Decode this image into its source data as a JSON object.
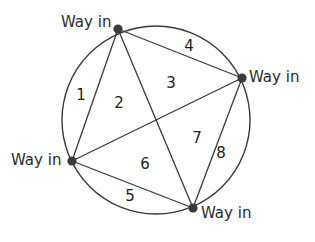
{
  "figure": {
    "type": "circle-chord-region-diagram",
    "background_color": "#ffffff",
    "stroke_color": "#3a3a3a",
    "dot_color": "#3b3b3b",
    "text_color": "#2b2b2b",
    "circle": {
      "cx": 156,
      "cy": 120,
      "r": 94
    },
    "vertices": [
      {
        "id": "top",
        "label": "Way in",
        "x": 118,
        "y": 29
      },
      {
        "id": "right",
        "label": "Way in",
        "x": 242,
        "y": 78
      },
      {
        "id": "left",
        "label": "Way in",
        "x": 72,
        "y": 161
      },
      {
        "id": "bottom",
        "label": "Way in",
        "x": 193,
        "y": 208
      }
    ],
    "chords": [
      {
        "from": "top",
        "to": "right"
      },
      {
        "from": "top",
        "to": "left"
      },
      {
        "from": "top",
        "to": "bottom"
      },
      {
        "from": "left",
        "to": "right"
      },
      {
        "from": "left",
        "to": "bottom"
      },
      {
        "from": "right",
        "to": "bottom"
      }
    ],
    "regions": [
      {
        "id": "1",
        "label": "1",
        "x": 81,
        "y": 95
      },
      {
        "id": "2",
        "label": "2",
        "x": 119,
        "y": 103
      },
      {
        "id": "3",
        "label": "3",
        "x": 171,
        "y": 83
      },
      {
        "id": "4",
        "label": "4",
        "x": 189,
        "y": 46
      },
      {
        "id": "5",
        "label": "5",
        "x": 130,
        "y": 196
      },
      {
        "id": "6",
        "label": "6",
        "x": 145,
        "y": 164
      },
      {
        "id": "7",
        "label": "7",
        "x": 197,
        "y": 138
      },
      {
        "id": "8",
        "label": "8",
        "x": 221,
        "y": 153
      }
    ]
  },
  "labels": {
    "way_in_top": "Way in",
    "way_in_right": "Way in",
    "way_in_left": "Way in",
    "way_in_bottom": "Way in",
    "region_1": "1",
    "region_2": "2",
    "region_3": "3",
    "region_4": "4",
    "region_5": "5",
    "region_6": "6",
    "region_7": "7",
    "region_8": "8"
  }
}
